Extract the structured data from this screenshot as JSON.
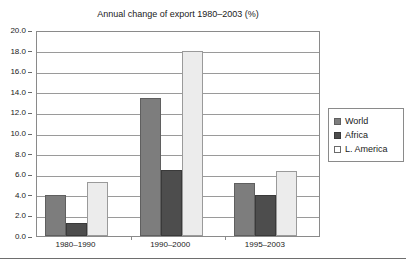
{
  "chart_data": {
    "type": "bar",
    "title": "Annual change of export 1980–2003 (%)",
    "xlabel": "",
    "ylabel": "",
    "categories": [
      "1980–1990",
      "1990–2000",
      "1995–2003"
    ],
    "series": [
      {
        "name": "World",
        "values": [
          4.0,
          13.4,
          5.1
        ],
        "color": "#7d7d7d"
      },
      {
        "name": "Africa",
        "values": [
          1.3,
          6.4,
          4.0
        ],
        "color": "#4d4d4d"
      },
      {
        "name": "L. America",
        "values": [
          5.2,
          18.0,
          6.3
        ],
        "color": "#ececec"
      }
    ],
    "ylim": [
      0.0,
      20.0
    ],
    "ytick_step": 2.0,
    "yticks": [
      "0.0",
      "2.0",
      "4.0",
      "6.0",
      "8.0",
      "10.0",
      "12.0",
      "14.0",
      "16.0",
      "18.0",
      "20.0"
    ],
    "grid": true,
    "legend_position": "right"
  },
  "legend": {
    "items": [
      {
        "label": "World",
        "swatch": "series-world"
      },
      {
        "label": "Africa",
        "swatch": "series-africa"
      },
      {
        "label": "L. America",
        "swatch": "series-lamerica"
      }
    ]
  }
}
